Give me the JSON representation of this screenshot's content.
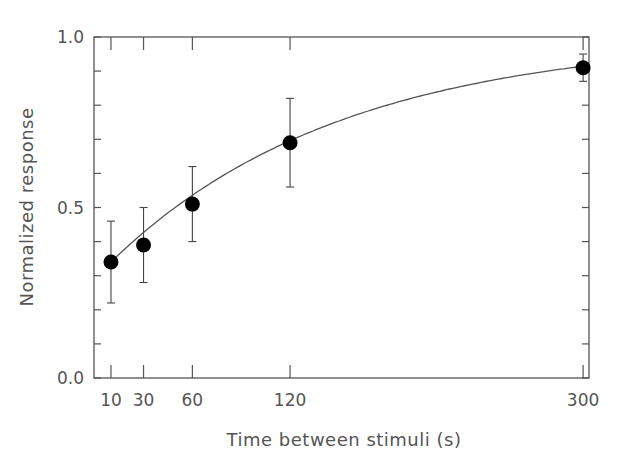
{
  "chart_data": {
    "type": "scatter",
    "title": "",
    "xlabel": "Time between stimuli (s)",
    "ylabel": "Normalized response",
    "xlim": [
      0,
      305
    ],
    "ylim": [
      0.0,
      1.0
    ],
    "x_ticks": [
      10,
      30,
      60,
      120,
      300
    ],
    "x_tick_labels": [
      "10",
      "30",
      "60",
      "120",
      "300"
    ],
    "y_ticks": [
      0.0,
      0.5,
      1.0
    ],
    "y_tick_labels": [
      "0.0",
      "0.5",
      "1.0"
    ],
    "y_minor_step": 0.1,
    "grid": false,
    "legend": null,
    "series": [
      {
        "name": "Normalized response",
        "marker": "filled-circle",
        "x": [
          10,
          30,
          60,
          120,
          300
        ],
        "y": [
          0.34,
          0.39,
          0.51,
          0.69,
          0.91
        ],
        "error_upper": [
          0.46,
          0.5,
          0.62,
          0.82,
          0.95
        ],
        "error_lower": [
          0.22,
          0.28,
          0.4,
          0.56,
          0.87
        ]
      }
    ],
    "fit_curve": {
      "type": "exponential-saturation",
      "formula": "y = A * (1 - B * exp(-t / tau))",
      "A": 1.0,
      "B": 0.708,
      "tau": 142,
      "x_range": [
        10,
        300
      ]
    }
  }
}
